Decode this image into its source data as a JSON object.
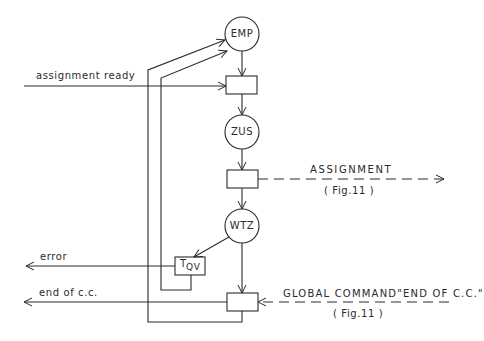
{
  "diagram": {
    "type": "state-transition-flow",
    "colors": {
      "stroke": "#2a2a2a",
      "background": "#ffffff"
    },
    "states": [
      {
        "id": "emp",
        "label": "EMP"
      },
      {
        "id": "zus",
        "label": "ZUS"
      },
      {
        "id": "wtz",
        "label": "WTZ"
      }
    ],
    "transitions": [
      {
        "id": "t1",
        "label": ""
      },
      {
        "id": "t2",
        "label": ""
      },
      {
        "id": "tqv",
        "label": "T",
        "subscript": "QV"
      },
      {
        "id": "t3",
        "label": ""
      }
    ],
    "signals": {
      "assignment_ready": "assignment ready",
      "assignment": "ASSIGNMENT",
      "assignment_ref": "( Fig.11 )",
      "error": "error",
      "end_of_cc": "end  of c.c.",
      "global_command": "GLOBAL COMMAND\"END OF C.C.\"",
      "global_command_ref": "( Fig.11 )"
    }
  }
}
